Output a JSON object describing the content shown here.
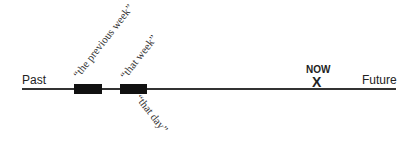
{
  "diagram": {
    "type": "timeline",
    "axis": {
      "left_label": "Past",
      "right_label": "Future"
    },
    "marker": {
      "label": "NOW",
      "symbol": "X"
    },
    "blocks": [
      {
        "name": "previous-week-block",
        "label": "“the previous week”"
      },
      {
        "name": "that-week-block",
        "label": "“that week”",
        "sub_label": "“that day”"
      }
    ],
    "colors": {
      "line": "#333333",
      "block": "#111111",
      "text": "#222222"
    }
  }
}
